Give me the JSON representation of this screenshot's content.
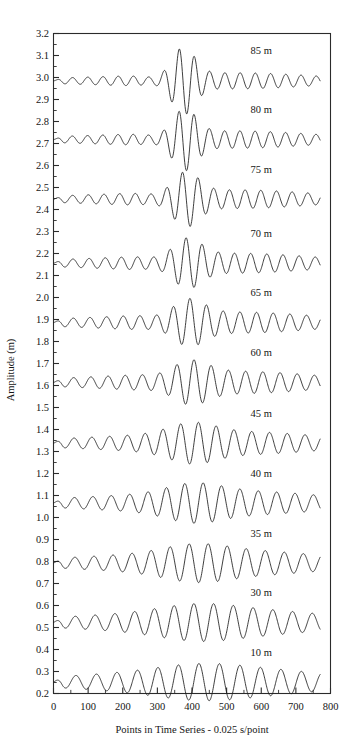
{
  "chart_data": {
    "type": "line",
    "title": "",
    "xlabel": "Points in Time Series - 0.025 s/point",
    "ylabel": "Amplitude (m)",
    "xlim": [
      0,
      800
    ],
    "ylim": [
      0.2,
      3.2
    ],
    "grid": false,
    "legend_position": "inline-right",
    "x_major_ticks": [
      0,
      100,
      200,
      300,
      400,
      500,
      600,
      700,
      800
    ],
    "x_minor_step": 50,
    "y_major_ticks": [
      0.2,
      0.3,
      0.4,
      0.5,
      0.6,
      0.7,
      0.8,
      0.9,
      1.0,
      1.1,
      1.2,
      1.3,
      1.4,
      1.5,
      1.6,
      1.7,
      1.8,
      1.9,
      2.0,
      2.1,
      2.2,
      2.3,
      2.4,
      2.5,
      2.6,
      2.7,
      2.8,
      2.9,
      3.0,
      3.1,
      3.2
    ],
    "x_tick_labels": [
      "0",
      "100",
      "200",
      "300",
      "400",
      "500",
      "600",
      "700",
      "800"
    ],
    "y_tick_labels": [
      "0.2",
      "0.3",
      "0.4",
      "0.5",
      "0.6",
      "0.7",
      "0.8",
      "0.9",
      "1.0",
      "1.1",
      "1.2",
      "1.3",
      "1.4",
      "1.5",
      "1.6",
      "1.7",
      "1.8",
      "1.9",
      "2.0",
      "2.1",
      "2.2",
      "2.3",
      "2.4",
      "2.5",
      "2.6",
      "2.7",
      "2.8",
      "2.9",
      "3.0",
      "3.1",
      "3.2"
    ],
    "x_data_start": 0,
    "x_data_end": 770,
    "series": [
      {
        "name": "85 m",
        "label": "85 m",
        "baseline": 2.985,
        "label_x": 600,
        "label_y": 3.105,
        "cycles": 17.5,
        "phase": 0.0,
        "base_amp": 0.022,
        "burst_center": 375,
        "burst_width": 46,
        "burst_amp": 0.125,
        "pre_dip_center": 300,
        "pre_dip_depth": 0.45,
        "tail_amp": 0.03,
        "tail_center": 560,
        "tail_width": 260
      },
      {
        "name": "80 m",
        "label": "80 m",
        "baseline": 2.718,
        "label_x": 600,
        "label_y": 2.838,
        "cycles": 17.5,
        "phase": 0.1,
        "base_amp": 0.024,
        "burst_center": 378,
        "burst_width": 48,
        "burst_amp": 0.11,
        "pre_dip_center": 305,
        "pre_dip_depth": 0.42,
        "tail_amp": 0.032,
        "tail_center": 560,
        "tail_width": 260
      },
      {
        "name": "75 m",
        "label": "75 m",
        "baseline": 2.447,
        "label_x": 600,
        "label_y": 2.567,
        "cycles": 17.0,
        "phase": 0.2,
        "base_amp": 0.026,
        "burst_center": 382,
        "burst_width": 52,
        "burst_amp": 0.092,
        "pre_dip_center": 308,
        "pre_dip_depth": 0.38,
        "tail_amp": 0.034,
        "tail_center": 565,
        "tail_width": 265
      },
      {
        "name": "70 m",
        "label": "70 m",
        "baseline": 2.156,
        "label_x": 600,
        "label_y": 2.276,
        "cycles": 16.5,
        "phase": 0.3,
        "base_amp": 0.028,
        "burst_center": 386,
        "burst_width": 56,
        "burst_amp": 0.078,
        "pre_dip_center": 312,
        "pre_dip_depth": 0.34,
        "tail_amp": 0.036,
        "tail_center": 565,
        "tail_width": 270
      },
      {
        "name": "65 m",
        "label": "65 m",
        "baseline": 1.886,
        "label_x": 600,
        "label_y": 2.006,
        "cycles": 16.0,
        "phase": 0.4,
        "base_amp": 0.03,
        "burst_center": 390,
        "burst_width": 62,
        "burst_amp": 0.068,
        "pre_dip_center": 315,
        "pre_dip_depth": 0.3,
        "tail_amp": 0.038,
        "tail_center": 570,
        "tail_width": 275
      },
      {
        "name": "60 m",
        "label": "60 m",
        "baseline": 1.614,
        "label_x": 600,
        "label_y": 1.734,
        "cycles": 15.5,
        "phase": 0.5,
        "base_amp": 0.032,
        "burst_center": 394,
        "burst_width": 70,
        "burst_amp": 0.058,
        "pre_dip_center": 318,
        "pre_dip_depth": 0.25,
        "tail_amp": 0.04,
        "tail_center": 570,
        "tail_width": 280
      },
      {
        "name": "45 m",
        "label": "45 m",
        "baseline": 1.338,
        "label_x": 600,
        "label_y": 1.458,
        "cycles": 15.0,
        "phase": 0.6,
        "base_amp": 0.034,
        "burst_center": 400,
        "burst_width": 92,
        "burst_amp": 0.046,
        "pre_dip_center": 0,
        "pre_dip_depth": 0.0,
        "tail_amp": 0.04,
        "tail_center": 575,
        "tail_width": 290
      },
      {
        "name": "40 m",
        "label": "40 m",
        "baseline": 1.066,
        "label_x": 600,
        "label_y": 1.186,
        "cycles": 14.5,
        "phase": 0.7,
        "base_amp": 0.036,
        "burst_center": 405,
        "burst_width": 105,
        "burst_amp": 0.04,
        "pre_dip_center": 0,
        "pre_dip_depth": 0.0,
        "tail_amp": 0.042,
        "tail_center": 575,
        "tail_width": 295
      },
      {
        "name": "35 m",
        "label": "35 m",
        "baseline": 0.793,
        "label_x": 600,
        "label_y": 0.913,
        "cycles": 14.0,
        "phase": 0.8,
        "base_amp": 0.038,
        "burst_center": 410,
        "burst_width": 125,
        "burst_amp": 0.034,
        "pre_dip_center": 0,
        "pre_dip_depth": 0.0,
        "tail_amp": 0.042,
        "tail_center": 580,
        "tail_width": 300
      },
      {
        "name": "30 m",
        "label": "30 m",
        "baseline": 0.523,
        "label_x": 600,
        "label_y": 0.643,
        "cycles": 13.5,
        "phase": 0.9,
        "base_amp": 0.04,
        "burst_center": 415,
        "burst_width": 145,
        "burst_amp": 0.028,
        "pre_dip_center": 0,
        "pre_dip_depth": 0.0,
        "tail_amp": 0.044,
        "tail_center": 580,
        "tail_width": 310
      },
      {
        "name": "10 m",
        "label": "10 m",
        "baseline": 0.252,
        "label_x": 600,
        "label_y": 0.372,
        "cycles": 13.0,
        "phase": 1.0,
        "base_amp": 0.042,
        "burst_center": 420,
        "burst_width": 165,
        "burst_amp": 0.024,
        "pre_dip_center": 0,
        "pre_dip_depth": 0.0,
        "tail_amp": 0.044,
        "tail_center": 585,
        "tail_width": 320
      }
    ]
  }
}
